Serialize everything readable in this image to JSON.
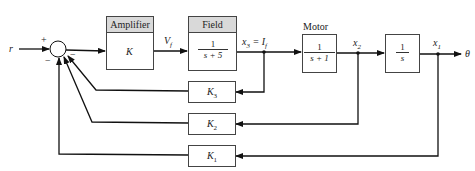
{
  "diagram": {
    "type": "block-diagram",
    "input": {
      "label": "r"
    },
    "output": {
      "label": "θ"
    },
    "summing_junction": {
      "signs": {
        "input": "+",
        "feedback": "−"
      }
    },
    "blocks": [
      {
        "id": "amplifier",
        "header": "Amplifier",
        "content": "K"
      },
      {
        "id": "field",
        "header": "Field",
        "numerator": "1",
        "denominator": "s + 5"
      },
      {
        "id": "motor",
        "header": "Motor",
        "numerator": "1",
        "denominator": "s + 1"
      },
      {
        "id": "integrator",
        "numerator": "1",
        "denominator": "s"
      }
    ],
    "signals": {
      "vf": "V",
      "vf_sub": "f",
      "x3": "x",
      "x3_sub": "3",
      "x3_eq": " = I",
      "x3_eq_sub": "f",
      "x2": "x",
      "x2_sub": "2",
      "x1": "x",
      "x1_sub": "1"
    },
    "feedback": [
      {
        "id": "k3",
        "label": "K",
        "sub": "3",
        "from": "x3"
      },
      {
        "id": "k2",
        "label": "K",
        "sub": "2",
        "from": "x2"
      },
      {
        "id": "k1",
        "label": "K",
        "sub": "1",
        "from": "x1"
      }
    ]
  }
}
